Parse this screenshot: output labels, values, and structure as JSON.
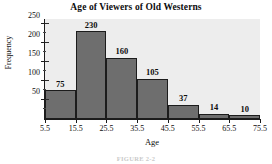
{
  "chart_data": {
    "type": "bar",
    "title": "Age of Viewers of Old Westerns",
    "xlabel": "Age",
    "ylabel": "Frequency",
    "categories": [
      "5.5-15.5",
      "15.5-25.5",
      "25.5-35.5",
      "35.5-45.5",
      "45.5-55.5",
      "55.5-65.5",
      "65.5-75.5"
    ],
    "values": [
      75,
      230,
      160,
      105,
      37,
      14,
      10
    ],
    "bin_edges": [
      5.5,
      15.5,
      25.5,
      35.5,
      45.5,
      55.5,
      65.5,
      75.5
    ],
    "x_tick_labels": [
      "5.5",
      "15.5",
      "25.5",
      "35.5",
      "45.5",
      "55.5",
      "65.5",
      "75.5"
    ],
    "y_tick_labels": [
      "50",
      "100",
      "150",
      "200",
      "250"
    ],
    "y_tick_values": [
      50,
      100,
      150,
      200,
      250
    ],
    "y_minor_tick_values": [
      25,
      75,
      125,
      175,
      225
    ],
    "ylim": [
      0,
      262
    ],
    "xlim": [
      5.5,
      75.5
    ],
    "grid": false,
    "legend": false,
    "bar_labels": [
      "75",
      "230",
      "160",
      "105",
      "37",
      "14",
      "10"
    ],
    "colors": {
      "bar_fill": "#6e6e6e",
      "bar_edge": "#1c1c1c",
      "plot_background": "#ededed",
      "figure_background": "#ffffff",
      "axis": "#1b1b1b",
      "text": "#0d0d0d"
    }
  },
  "figure": {
    "caption": "FIGURE 2-2"
  }
}
